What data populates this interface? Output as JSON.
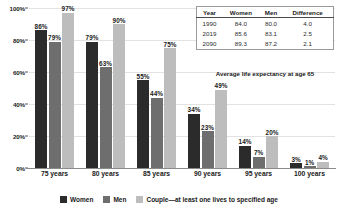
{
  "chart_data": {
    "type": "bar",
    "title": "",
    "xlabel": "",
    "ylabel": "",
    "ylim": [
      0,
      100
    ],
    "yticks": [
      "0%",
      "20%",
      "40%",
      "60%",
      "80%",
      "100%"
    ],
    "grid": true,
    "legend_position": "bottom",
    "categories": [
      "75 years",
      "80 years",
      "85 years",
      "90 years",
      "95 years",
      "100 years"
    ],
    "series": [
      {
        "name": "Women",
        "color": "#2b2b2b",
        "values": [
          86,
          79,
          55,
          34,
          14,
          3
        ],
        "labels": [
          "86%",
          "79%",
          "55%",
          "34%",
          "14%",
          "3%"
        ]
      },
      {
        "name": "Men",
        "color": "#6e6e6e",
        "values": [
          79,
          63,
          44,
          23,
          7,
          1
        ],
        "labels": [
          "79%",
          "63%",
          "44%",
          "23%",
          "7%",
          "1%"
        ]
      },
      {
        "name": "Couple—at least one lives to specified age",
        "color": "#bdbdbd",
        "values": [
          97,
          90,
          75,
          49,
          20,
          4
        ],
        "labels": [
          "97%",
          "90%",
          "75%",
          "49%",
          "20%",
          "4%"
        ]
      }
    ]
  },
  "legend": {
    "items": [
      {
        "label": "Women",
        "color": "#2b2b2b"
      },
      {
        "label": "Men",
        "color": "#6e6e6e"
      },
      {
        "label": "Couple—at least one lives to specified age",
        "color": "#bdbdbd"
      }
    ]
  },
  "table": {
    "caption": "Average life expectancy at age 65",
    "columns": [
      "Year",
      "Women",
      "Men",
      "Difference"
    ],
    "rows": [
      [
        "1990",
        "84.0",
        "80.0",
        "4.0"
      ],
      [
        "2019",
        "85.6",
        "83.1",
        "2.5"
      ],
      [
        "2090",
        "89.3",
        "87.2",
        "2.1"
      ]
    ]
  }
}
